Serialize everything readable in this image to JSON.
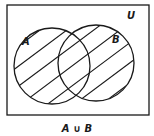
{
  "diagram": {
    "type": "venn",
    "universe_label": "U",
    "sets": [
      {
        "label": "A",
        "shaded": true
      },
      {
        "label": "B",
        "shaded": true
      }
    ],
    "caption": "A ∪ B",
    "stroke_color": "#1a1a1a",
    "background": "#ffffff"
  }
}
